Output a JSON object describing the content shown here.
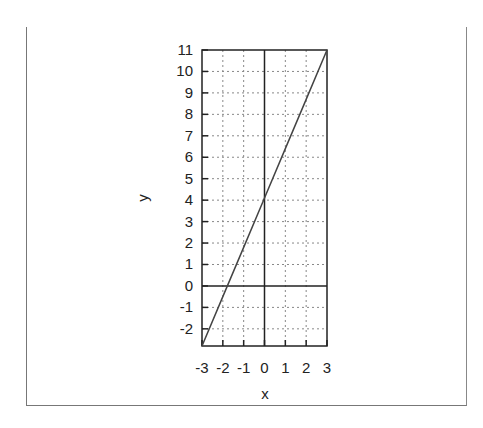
{
  "chart_data": {
    "type": "line",
    "title": "",
    "xlabel": "x",
    "ylabel": "y",
    "xlim": [
      -3,
      3
    ],
    "ylim": [
      -2.8,
      11
    ],
    "grid": true,
    "legend": null,
    "x_ticks": [
      "-3",
      "-2",
      "-1",
      "0",
      "1",
      "2",
      "3"
    ],
    "y_ticks": [
      "-2",
      "-1",
      "0",
      "1",
      "2",
      "3",
      "4",
      "5",
      "6",
      "7",
      "8",
      "9",
      "10",
      "11"
    ],
    "series": [
      {
        "name": "y = 2.3x + 4.1",
        "x": [
          -3,
          -2,
          -1,
          0,
          1,
          2,
          3
        ],
        "y": [
          -2.8,
          -0.5,
          1.8,
          4.1,
          6.4,
          8.7,
          11
        ]
      }
    ],
    "reference_lines": {
      "x": 0,
      "y": 0
    }
  },
  "labels": {
    "x": "x",
    "y": "y"
  }
}
